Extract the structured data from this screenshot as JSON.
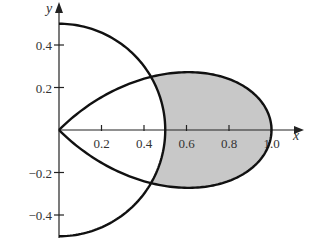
{
  "figure": {
    "axis_labels": {
      "x": "x",
      "y": "y"
    },
    "x_ticks": [
      {
        "value": 0.2,
        "label": "0.2"
      },
      {
        "value": 0.4,
        "label": "0.4"
      },
      {
        "value": 0.6,
        "label": "0.6"
      },
      {
        "value": 0.8,
        "label": "0.8"
      },
      {
        "value": 1.0,
        "label": "1.0"
      }
    ],
    "y_ticks": [
      {
        "value": 0.4,
        "label": "0.4"
      },
      {
        "value": 0.2,
        "label": "0.2"
      },
      {
        "value": -0.2,
        "label": "−0.2"
      },
      {
        "value": -0.4,
        "label": "−0.4"
      }
    ],
    "curves": [
      {
        "name": "circle",
        "polar": "r = 1/2",
        "theta_range": [
          -1.5708,
          1.5708
        ]
      },
      {
        "name": "rose-petal",
        "polar": "r = cos(2θ)",
        "theta_range": [
          -0.7854,
          0.7854
        ]
      }
    ],
    "shaded_region": {
      "description": "inside r = cos 2θ and outside r = 1/2",
      "fill": "#c8c8c8"
    },
    "colors": {
      "stroke": "#111111",
      "shade": "#c8c8c8",
      "text": "#333333"
    }
  },
  "chart_data": {
    "type": "line",
    "title": "",
    "xlabel": "x",
    "ylabel": "y",
    "xlim": [
      0,
      1.1
    ],
    "ylim": [
      -0.5,
      0.5
    ],
    "x_tick_labels": [
      "0.2",
      "0.4",
      "0.6",
      "0.8",
      "1.0"
    ],
    "y_tick_labels": [
      "0.4",
      "0.2",
      "-0.2",
      "-0.4"
    ],
    "series": [
      {
        "name": "r = 1/2 (right semicircle)",
        "points": [
          [
            0,
            0.5
          ],
          [
            0.25,
            0.433
          ],
          [
            0.433,
            0.25
          ],
          [
            0.5,
            0
          ],
          [
            0.433,
            -0.25
          ],
          [
            0.25,
            -0.433
          ],
          [
            0,
            -0.5
          ]
        ]
      },
      {
        "name": "r = cos 2θ (petal)",
        "points": [
          [
            0,
            0
          ],
          [
            0.433,
            0.25
          ],
          [
            0.62,
            0.27
          ],
          [
            0.85,
            0.18
          ],
          [
            1.0,
            0
          ],
          [
            0.85,
            -0.18
          ],
          [
            0.62,
            -0.27
          ],
          [
            0.433,
            -0.25
          ],
          [
            0,
            0
          ]
        ]
      }
    ],
    "intersections": [
      [
        0.433,
        0.25
      ],
      [
        0.433,
        -0.25
      ]
    ],
    "grid": false,
    "legend": "none",
    "annotations": [
      "shaded region between curves, x from ~0.43 to 1.0"
    ]
  }
}
